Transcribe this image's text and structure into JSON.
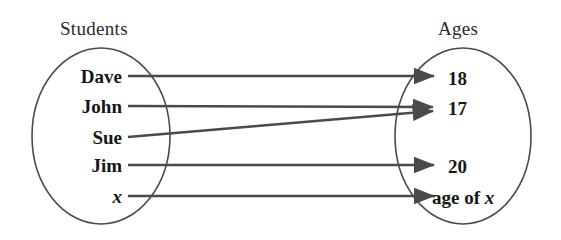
{
  "figure": {
    "type": "mapping-diagram",
    "background_color": "#ffffff",
    "stroke_color": "#4a4a4a",
    "text_color": "#161616"
  },
  "domain_set": {
    "title": "Students",
    "shape": "ellipse",
    "members": [
      {
        "label": "Dave",
        "italic": false,
        "y": 76
      },
      {
        "label": "John",
        "italic": false,
        "y": 106
      },
      {
        "label": "Sue",
        "italic": false,
        "y": 137
      },
      {
        "label": "Jim",
        "italic": false,
        "y": 165
      },
      {
        "label": "x",
        "italic": true,
        "y": 196
      }
    ]
  },
  "codomain_set": {
    "title": "Ages",
    "shape": "ellipse",
    "members": [
      {
        "label": "18",
        "italic": false,
        "y": 78
      },
      {
        "label": "17",
        "italic": false,
        "y": 108
      },
      {
        "label": "20",
        "italic": false,
        "y": 166
      },
      {
        "label": "age of x",
        "italic_tail": "x",
        "y": 197
      }
    ]
  },
  "mappings": [
    {
      "from": "Dave",
      "to": "18",
      "x1": 128,
      "y1": 76,
      "x2": 434,
      "y2": 76
    },
    {
      "from": "John",
      "to": "17",
      "x1": 128,
      "y1": 106,
      "x2": 434,
      "y2": 107
    },
    {
      "from": "Sue",
      "to": "17",
      "x1": 128,
      "y1": 137,
      "x2": 434,
      "y2": 111
    },
    {
      "from": "Jim",
      "to": "20",
      "x1": 128,
      "y1": 165,
      "x2": 434,
      "y2": 165
    },
    {
      "from": "x",
      "to": "age of x",
      "x1": 128,
      "y1": 196,
      "x2": 434,
      "y2": 196
    }
  ]
}
